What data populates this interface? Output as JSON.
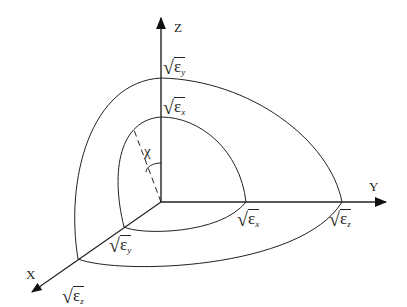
{
  "diagram": {
    "type": "3D coordinate index ellipsoid octant diagram",
    "axes": {
      "x_label": "X",
      "y_label": "Y",
      "z_label": "Z"
    },
    "labels": {
      "z_outer": {
        "symbol": "ε",
        "sub": "y"
      },
      "z_inner": {
        "symbol": "ε",
        "sub": "x"
      },
      "y_inner": {
        "symbol": "ε",
        "sub": "x"
      },
      "y_outer": {
        "symbol": "ε",
        "sub": "z"
      },
      "x_inner": {
        "symbol": "ε",
        "sub": "y"
      },
      "x_outer": {
        "symbol": "ε",
        "sub": "z"
      },
      "angle": "χ"
    },
    "colors": {
      "line": "#222222",
      "background": "#ffffff"
    }
  }
}
